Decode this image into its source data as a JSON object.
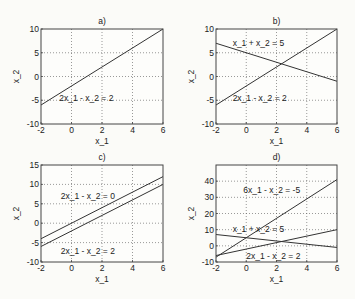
{
  "figure": {
    "background": "#fbfbf8",
    "line_color": "#333333",
    "grid_color": "#555555"
  },
  "chart_data": [
    {
      "id": "a",
      "type": "line",
      "title": "a)",
      "xlabel": "x_1",
      "ylabel": "x_2",
      "xlim": [
        -2,
        6
      ],
      "ylim": [
        -10,
        10
      ],
      "xticks": [
        -2,
        0,
        2,
        4,
        6
      ],
      "yticks": [
        -10,
        -5,
        0,
        5,
        10
      ],
      "grid": true,
      "box_px": {
        "left": 41,
        "top": 29,
        "right": 163,
        "bottom": 124
      },
      "series": [
        {
          "name": "2x_1 - x_2 = 2",
          "x": [
            -2,
            6
          ],
          "y": [
            -6,
            10
          ]
        }
      ],
      "annotations": [
        {
          "text": "2x_1 - x_2 = 2",
          "x": -0.8,
          "y": -4.6
        }
      ]
    },
    {
      "id": "b",
      "type": "line",
      "title": "b)",
      "xlabel": "x_1",
      "ylabel": "x_2",
      "xlim": [
        -2,
        6
      ],
      "ylim": [
        -10,
        10
      ],
      "xticks": [
        -2,
        0,
        2,
        4,
        6
      ],
      "yticks": [
        -10,
        -5,
        0,
        5,
        10
      ],
      "grid": true,
      "box_px": {
        "left": 216,
        "top": 29,
        "right": 337,
        "bottom": 124
      },
      "series": [
        {
          "name": "2x_1 - x_2 = 2",
          "x": [
            -2,
            6
          ],
          "y": [
            -6,
            10
          ]
        },
        {
          "name": "x_1 + x_2 = 5",
          "x": [
            -2,
            6
          ],
          "y": [
            7,
            -1
          ]
        }
      ],
      "annotations": [
        {
          "text": "x_1 + x_2 = 5",
          "x": -0.9,
          "y": 7.0
        },
        {
          "text": "2x_1 - x_2 = 2",
          "x": -0.9,
          "y": -4.6
        }
      ]
    },
    {
      "id": "c",
      "type": "line",
      "title": "c)",
      "xlabel": "x_1",
      "ylabel": "x_2",
      "xlim": [
        -2,
        6
      ],
      "ylim": [
        -10,
        15
      ],
      "xticks": [
        -2,
        0,
        2,
        4,
        6
      ],
      "yticks": [
        -10,
        -5,
        0,
        5,
        10,
        15
      ],
      "grid": true,
      "box_px": {
        "left": 41,
        "top": 165,
        "right": 163,
        "bottom": 262
      },
      "series": [
        {
          "name": "2x_1 - x_2 = 0",
          "x": [
            -2,
            6
          ],
          "y": [
            -4,
            12
          ]
        },
        {
          "name": "2x_1 - x_2 = 2",
          "x": [
            -2,
            6
          ],
          "y": [
            -6,
            10
          ]
        }
      ],
      "annotations": [
        {
          "text": "2x_1 - x_2 = 0",
          "x": -0.7,
          "y": 7.0
        },
        {
          "text": "2x_1 - x_2 = 2",
          "x": -0.7,
          "y": -7.2
        }
      ]
    },
    {
      "id": "d",
      "type": "line",
      "title": "d)",
      "xlabel": "x_1",
      "ylabel": "x_2",
      "xlim": [
        -2,
        6
      ],
      "ylim": [
        -10,
        50
      ],
      "xticks": [
        -2,
        0,
        2,
        4,
        6
      ],
      "yticks": [
        -10,
        0,
        10,
        20,
        30,
        40
      ],
      "grid": true,
      "box_px": {
        "left": 216,
        "top": 165,
        "right": 337,
        "bottom": 262
      },
      "series": [
        {
          "name": "6x_1 - x_2 = -5",
          "x": [
            -2,
            6
          ],
          "y": [
            -7,
            41
          ]
        },
        {
          "name": "x_1 + x_2 = 5",
          "x": [
            -2,
            6
          ],
          "y": [
            7,
            -1
          ]
        },
        {
          "name": "2x_1 - x_2 = 2",
          "x": [
            -2,
            6
          ],
          "y": [
            -6,
            10
          ]
        }
      ],
      "annotations": [
        {
          "text": "6x_1 - x_2 = -5",
          "x": -0.2,
          "y": 34.5
        },
        {
          "text": "x_1 + x_2 = 5",
          "x": -0.9,
          "y": 10.5
        },
        {
          "text": "2x_1 - x_2 = 2",
          "x": 0.0,
          "y": -6.5
        }
      ]
    }
  ]
}
